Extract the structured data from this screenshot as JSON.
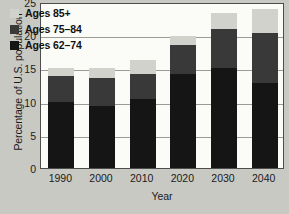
{
  "chart_data": {
    "type": "bar",
    "subtype": "stacked-bar",
    "title": "",
    "xlabel": "Year",
    "ylabel": "Percentage of U.S. population",
    "categories": [
      "1990",
      "2000",
      "2010",
      "2020",
      "2030",
      "2040"
    ],
    "ylim": [
      0,
      25
    ],
    "yticks": [
      0,
      5,
      10,
      15,
      20,
      25
    ],
    "ytick_labels": [
      "0",
      "5",
      "10",
      "15",
      "20",
      "25"
    ],
    "grid": true,
    "grid_axis": "y",
    "legend_position": "top-left",
    "series": [
      {
        "name": "Ages 62–74",
        "color": "#151515",
        "values": [
          10.0,
          9.3,
          10.4,
          14.2,
          15.0,
          12.8
        ]
      },
      {
        "name": "Ages 75–84",
        "color": "#393939",
        "values": [
          3.8,
          4.3,
          3.8,
          4.3,
          6.0,
          7.6
        ]
      },
      {
        "name": "Ages 85+",
        "color": "#d2d2cd",
        "values": [
          1.2,
          1.4,
          2.1,
          1.4,
          2.4,
          3.6
        ]
      }
    ],
    "totals": [
      15.0,
      15.0,
      16.3,
      19.9,
      23.4,
      24.0
    ]
  },
  "legend": {
    "items": [
      {
        "label": "Ages 85+",
        "swatch": "#d2d2cd"
      },
      {
        "label": "Ages 75–84",
        "swatch": "#393939"
      },
      {
        "label": "Ages 62–74",
        "swatch": "#151515"
      }
    ]
  },
  "colors": {
    "page_background": "#c9c9c4",
    "plot_background": "#fbfbf7",
    "axis_line": "#4d4d4d",
    "gridline": "#9a9a96",
    "text": "#1a1a1a"
  }
}
